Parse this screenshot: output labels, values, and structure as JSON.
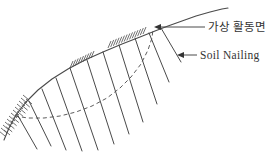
{
  "diagram": {
    "type": "technical-sketch",
    "background_color": "#ffffff",
    "line_color": "#4a4a4a",
    "text_color": "#333333",
    "labels": [
      {
        "name": "sliding-surface-label",
        "text": "가상 활동면"
      },
      {
        "name": "soil-nailing-label",
        "text": "Soil Nailing"
      }
    ],
    "geometry": {
      "slope_surface": [
        [
          4,
          140
        ],
        [
          9,
          128
        ],
        [
          16,
          115
        ],
        [
          26,
          102
        ],
        [
          38,
          90
        ],
        [
          52,
          79
        ],
        [
          68,
          69
        ],
        [
          85,
          60
        ],
        [
          103,
          52
        ],
        [
          122,
          44
        ],
        [
          140,
          37
        ],
        [
          155,
          31
        ],
        [
          168,
          26
        ],
        [
          182,
          21
        ],
        [
          196,
          16
        ],
        [
          210,
          12
        ],
        [
          222,
          9
        ],
        [
          228,
          8
        ]
      ],
      "sliding_surface_dashed": [
        [
          15,
          116
        ],
        [
          28,
          118
        ],
        [
          44,
          118
        ],
        [
          60,
          116
        ],
        [
          76,
          112
        ],
        [
          92,
          106
        ],
        [
          107,
          98
        ],
        [
          120,
          88
        ],
        [
          131,
          77
        ],
        [
          141,
          64
        ],
        [
          148,
          50
        ],
        [
          152,
          38
        ],
        [
          153,
          29
        ]
      ],
      "nails": [
        [
          17,
          114,
          37,
          149
        ],
        [
          29,
          101,
          51,
          146
        ],
        [
          42,
          89,
          66,
          150
        ],
        [
          56,
          78,
          82,
          151
        ],
        [
          70,
          68,
          98,
          150
        ],
        [
          87,
          60,
          114,
          144
        ],
        [
          103,
          52,
          129,
          134
        ],
        [
          119,
          45,
          143,
          122
        ],
        [
          135,
          38,
          157,
          104
        ],
        [
          149,
          33,
          169,
          82
        ],
        [
          161,
          28,
          181,
          62
        ]
      ],
      "hatch_patches": [
        {
          "baseline": [
            [
              5,
              136
            ],
            [
              29,
              100
            ]
          ],
          "stroke": [
            -6,
            -5
          ],
          "count": 13
        },
        {
          "baseline": [
            [
              10,
              135
            ],
            [
              32,
              104
            ]
          ],
          "stroke": [
            -6,
            -5
          ],
          "count": 11
        },
        {
          "baseline": [
            [
              70,
              68
            ],
            [
              91,
              58
            ]
          ],
          "stroke": [
            3,
            -7
          ],
          "count": 9
        },
        {
          "baseline": [
            [
              108,
              48
            ],
            [
              143,
              34
            ]
          ],
          "stroke": [
            3,
            -7
          ],
          "count": 14
        }
      ],
      "arrows": [
        {
          "tip": [
            154,
            27
          ],
          "tail": [
            205,
            27
          ]
        },
        {
          "tip": [
            177,
            55
          ],
          "tail": [
            197,
            55
          ]
        }
      ]
    }
  }
}
